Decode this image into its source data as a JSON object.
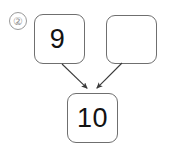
{
  "problem": {
    "marker_label": "②",
    "marker_icon": "circled-number-icon"
  },
  "diagram": {
    "type": "number-bond-addition",
    "colors": {
      "background": "#ffffff",
      "box_border": "#6f6f6f",
      "digit": "#121212",
      "marker": "#8e8e8e",
      "arrow": "#3a3a3a"
    },
    "boxes": [
      {
        "role": "addend-1",
        "value": "9",
        "empty": false
      },
      {
        "role": "addend-2",
        "value": "",
        "empty": true
      },
      {
        "role": "sum",
        "value": "10",
        "empty": false
      }
    ],
    "arrows": [
      {
        "name": "arrow-addend-1-to-sum",
        "from": "addend-1",
        "to": "sum",
        "x1": 62,
        "y1": 64,
        "x2": 89,
        "y2": 90
      },
      {
        "name": "arrow-addend-2-to-sum",
        "from": "addend-2",
        "to": "sum",
        "x1": 122,
        "y1": 63,
        "x2": 95,
        "y2": 90
      }
    ]
  }
}
